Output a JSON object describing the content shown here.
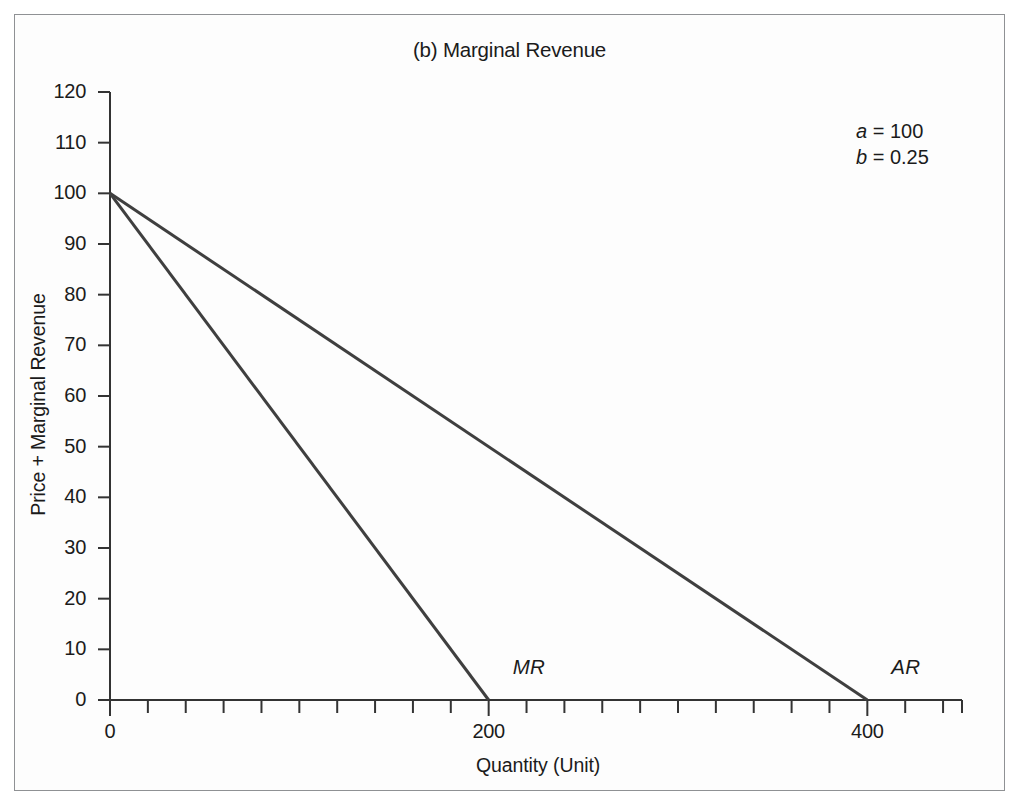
{
  "figure": {
    "title": "(b) Marginal Revenue",
    "background_color": "#ffffff",
    "frame_color": "#8f9194"
  },
  "parameters": [
    {
      "name": "a",
      "eq": "=",
      "value": "100"
    },
    {
      "name": "b",
      "eq": "=",
      "value": "0.25"
    }
  ],
  "axes": {
    "x_title": "Quantity (Unit)",
    "y_title": "Price + Marginal Revenue",
    "x_ticks": [
      "0",
      "200",
      "400"
    ],
    "y_ticks": [
      "0",
      "10",
      "20",
      "30",
      "40",
      "50",
      "60",
      "70",
      "80",
      "90",
      "100",
      "110",
      "120"
    ]
  },
  "curve_labels": {
    "mr": "MR",
    "ar": "AR"
  },
  "chart_data": {
    "type": "line",
    "title": "(b) Marginal Revenue",
    "xlabel": "Quantity (Unit)",
    "ylabel": "Price + Marginal Revenue",
    "xlim": [
      0,
      450
    ],
    "ylim": [
      0,
      120
    ],
    "x_tick_values": [
      0,
      200,
      400
    ],
    "x_minor_tick_step": 20,
    "y_tick_values": [
      0,
      10,
      20,
      30,
      40,
      50,
      60,
      70,
      80,
      90,
      100,
      110,
      120
    ],
    "grid": false,
    "legend": "inline-curve-labels",
    "parameters": {
      "a": 100,
      "b": 0.25
    },
    "series": [
      {
        "name": "AR",
        "label": "AR",
        "equation": "P = a - b*Q = 100 - 0.25Q",
        "color": "#3f3f3f",
        "x": [
          0,
          400
        ],
        "values": [
          100,
          0
        ]
      },
      {
        "name": "MR",
        "label": "MR",
        "equation": "MR = a - 2b*Q = 100 - 0.5Q",
        "color": "#3f3f3f",
        "x": [
          0,
          200
        ],
        "values": [
          100,
          0
        ]
      }
    ],
    "annotations": [
      {
        "text": "a = 100",
        "x": 430,
        "y": 113
      },
      {
        "text": "b = 0.25",
        "x": 430,
        "y": 108
      },
      {
        "text": "MR",
        "x": 215,
        "y": 8
      },
      {
        "text": "AR",
        "x": 415,
        "y": 8
      }
    ]
  }
}
